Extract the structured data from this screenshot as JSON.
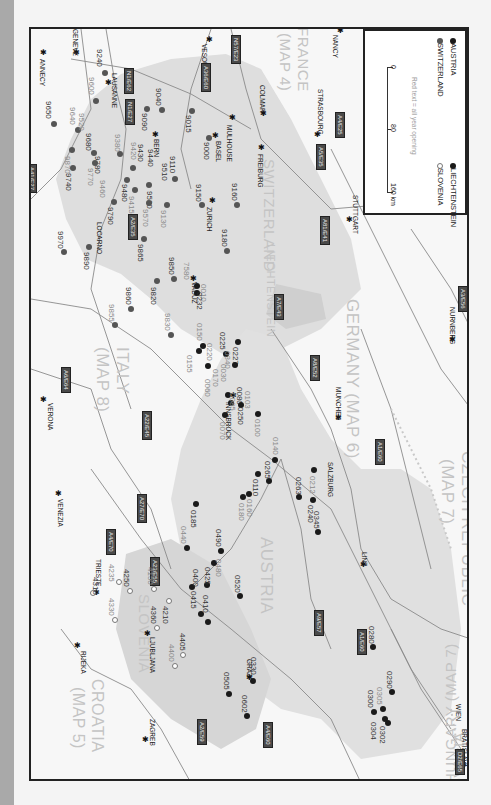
{
  "legend": {
    "items": [
      {
        "label": "AUSTRIA",
        "marker": "filled-black-dot"
      },
      {
        "label": "LIECHTENSTEIN",
        "marker": "filled-black-dot"
      },
      {
        "label": "SWITZERLAND",
        "marker": "filled-gray-dot"
      },
      {
        "label": "SLOVENIA",
        "marker": "hollow-circle"
      }
    ],
    "note": "Red text = all year opening",
    "scale": {
      "ticks": [
        "0",
        "80",
        "160 km"
      ]
    }
  },
  "countries": [
    {
      "label": "FRANCE",
      "sub": "(MAP 4)"
    },
    {
      "label": "SWITZERLAND",
      "sub": ""
    },
    {
      "label": "LIECHTENSTEIN",
      "sub": ""
    },
    {
      "label": "GERMANY (MAP 6)",
      "sub": ""
    },
    {
      "label": "ITALY",
      "sub": "(MAP 8)"
    },
    {
      "label": "AUSTRIA",
      "sub": ""
    },
    {
      "label": "CZECH REPUBLIC",
      "sub": "(MAP 7)"
    },
    {
      "label": "SLOVENIA",
      "sub": ""
    },
    {
      "label": "CROATIA",
      "sub": "(MAP 5)"
    },
    {
      "label": "HUNGARY (MAP 7)",
      "sub": ""
    },
    {
      "label": "SLOVAKIA",
      "sub": "(MAP 7)"
    }
  ],
  "cities": [
    "NANCY",
    "VESOUL",
    "STRASBOURG",
    "COLMAR",
    "MULHOUSE",
    "BASEL",
    "FREIBURG",
    "STUTTGART",
    "NURNBERG",
    "MUNCHEN",
    "GENEVE",
    "ANNECY",
    "LAUSANNE",
    "BERN",
    "LOCARNO",
    "ZURICH",
    "VADUZ",
    "INNSBRUCK",
    "SALZBURG",
    "LINZ",
    "WIEN",
    "BRATISLAVA",
    "GRAZ",
    "LJUBLJANA",
    "TRIESTE",
    "RIJEKA",
    "ZAGREB",
    "VERONA",
    "VENEZIA"
  ],
  "roads": [
    "N57/E23",
    "A36/E60",
    "A4/E25",
    "A5/E35",
    "N1/E62",
    "N1/E27",
    "A9/E62",
    "A2/E35",
    "A81/E41",
    "A7/E43",
    "A8/E52",
    "A3/E56",
    "A1/E60",
    "A9/E57",
    "A1/E55",
    "A6/E64",
    "A4/E70",
    "A22/E45",
    "A27/E70",
    "A23/E55",
    "A2/E59",
    "A4/E60",
    "D2/E65",
    "A41/E27",
    "A2/E63"
  ],
  "codes": {
    "switzerland": [
      "9240",
      "9600",
      "9040",
      "9090",
      "9015",
      "9000",
      "9650",
      "9640",
      "9520",
      "9680",
      "9870",
      "9780",
      "9770",
      "9740",
      "9380",
      "9430",
      "9420",
      "9440",
      "9480",
      "9110",
      "9510",
      "9530",
      "9570",
      "9460",
      "9415",
      "9130",
      "9790",
      "9150",
      "9160",
      "9180",
      "9970",
      "9890",
      "9865",
      "9850",
      "9820",
      "9860",
      "9855",
      "9830",
      "7580"
    ],
    "liechtenstein": [
      "0010",
      "0232"
    ],
    "austria": [
      "0150",
      "0155",
      "0220",
      "0225",
      "0227",
      "0340",
      "0030",
      "0170",
      "0060",
      "0080",
      "0085",
      "0250",
      "0070",
      "0100",
      "0103",
      "0140",
      "0265",
      "0110",
      "0160",
      "0180",
      "0185",
      "0440",
      "0490",
      "0480",
      "0425",
      "0400",
      "0415",
      "0410",
      "0520",
      "0212",
      "0240",
      "0263",
      "0345",
      "0330",
      "0505",
      "0602",
      "0280",
      "0290",
      "0305",
      "0300",
      "0304",
      "0302"
    ],
    "slovenia": [
      "4235",
      "4250",
      "4150",
      "4210",
      "4360",
      "4330",
      "4310",
      "4405",
      "4400"
    ]
  }
}
